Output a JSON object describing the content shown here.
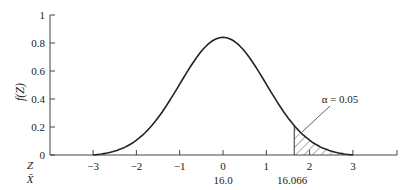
{
  "chart_data": {
    "type": "line",
    "title": "",
    "xlabel": "Z",
    "xlabel2": "X̄",
    "ylabel": "f(Z)",
    "ylim": [
      0,
      1
    ],
    "xlim": [
      -4,
      4
    ],
    "grid": false,
    "legend": null,
    "y_ticks": [
      "0",
      "0.2",
      "0.4",
      "0.6",
      "0.8",
      "1"
    ],
    "y_tick_values": [
      0,
      0.2,
      0.4,
      0.6,
      0.8,
      1
    ],
    "x_ticks": [
      "−3",
      "−2",
      "−1",
      "0",
      "1",
      "2",
      "3"
    ],
    "x_tick_values": [
      -3,
      -2,
      -1,
      0,
      1,
      2,
      3
    ],
    "x2_ticks": [
      {
        "label": "16.0",
        "z": 0
      },
      {
        "label": "16.066",
        "z": 1.645
      }
    ],
    "series": [
      {
        "name": "f(Z)",
        "x": [
          -3,
          -2.5,
          -2,
          -1.5,
          -1,
          -0.5,
          0,
          0.5,
          1,
          1.5,
          2,
          2.5,
          3
        ],
        "values": [
          0.0,
          0.04,
          0.11,
          0.26,
          0.48,
          0.73,
          0.85,
          0.73,
          0.48,
          0.26,
          0.11,
          0.04,
          0.0
        ]
      }
    ],
    "shaded_region": {
      "from": 1.645,
      "to": 3,
      "pattern": "hatch"
    },
    "annotation": {
      "text": "α = 0.05",
      "x": 2.0,
      "y": 0.36
    }
  }
}
